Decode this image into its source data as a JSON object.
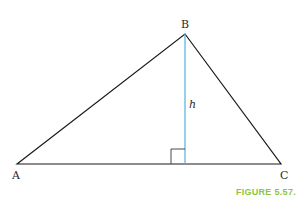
{
  "figure": {
    "caption": "FIGURE 5.57.",
    "caption_color": "#8cc63f",
    "altitude_color": "#4fb3d9"
  },
  "triangle": {
    "vertices": {
      "A": {
        "label": "A",
        "x": 17,
        "y": 164
      },
      "B": {
        "label": "B",
        "x": 185,
        "y": 34
      },
      "C": {
        "label": "C",
        "x": 281,
        "y": 164
      }
    },
    "altitude": {
      "label": "h",
      "foot_x": 185,
      "foot_y": 164
    },
    "right_angle_marker": true
  }
}
